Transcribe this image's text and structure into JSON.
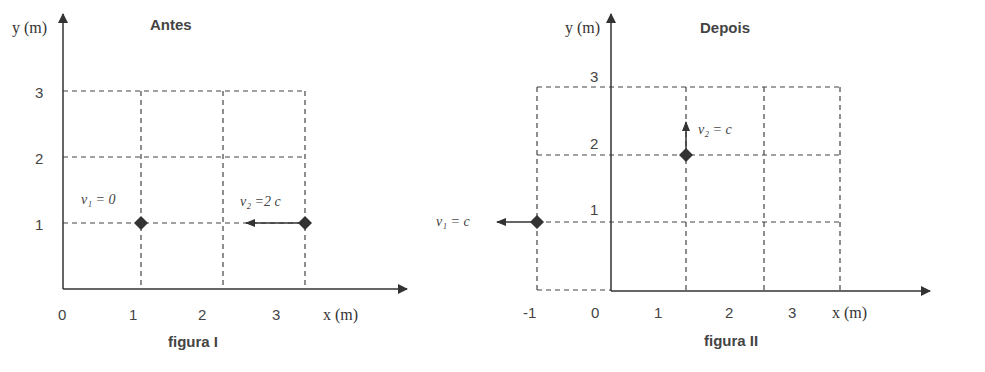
{
  "figures": [
    {
      "caption": "figura I",
      "title": "Antes",
      "y_axis_label": "y (m)",
      "x_axis_label": "x (m)",
      "x_ticks": [
        "0",
        "1",
        "2",
        "3"
      ],
      "y_ticks": [
        "1",
        "2",
        "3"
      ],
      "particles": [
        {
          "name": "particle-1",
          "velocity_label": "v₁ = 0",
          "position": [
            1,
            1
          ],
          "velocity": "0"
        },
        {
          "name": "particle-2",
          "velocity_label": "v₂ =2 c",
          "position": [
            3,
            1
          ],
          "velocity": "2c",
          "direction": "-x"
        }
      ]
    },
    {
      "caption": "figura II",
      "title": "Depois",
      "y_axis_label": "y (m)",
      "x_axis_label": "x (m)",
      "x_ticks": [
        "-1",
        "0",
        "1",
        "2",
        "3"
      ],
      "y_ticks": [
        "1",
        "2",
        "3"
      ],
      "particles": [
        {
          "name": "particle-1",
          "velocity_label": "v₁ = c",
          "position": [
            -1,
            1
          ],
          "velocity": "c",
          "direction": "-x"
        },
        {
          "name": "particle-2",
          "velocity_label": "v₂ = c",
          "position": [
            1,
            2
          ],
          "velocity": "c",
          "direction": "+y"
        }
      ]
    }
  ],
  "colors": {
    "ink": "#333333",
    "grid": "#444444",
    "background": "#ffffff"
  }
}
